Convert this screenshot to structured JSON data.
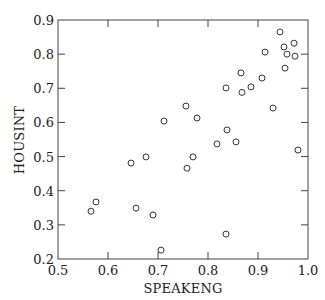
{
  "chart_data": {
    "type": "scatter",
    "title": "",
    "xlabel": "SPEAKENG",
    "ylabel": "HOUSINT",
    "xlim": [
      0.5,
      1.0
    ],
    "ylim": [
      0.2,
      0.9
    ],
    "xticks": [
      "0.5",
      "0.6",
      "0.7",
      "0.8",
      "0.9",
      "1.0"
    ],
    "yticks": [
      "0.2",
      "0.3",
      "0.4",
      "0.5",
      "0.6",
      "0.7",
      "0.8",
      "0.9"
    ],
    "grid": false,
    "legend": null,
    "marker": "open-circle",
    "points": [
      {
        "x": 0.944,
        "y": 0.865
      },
      {
        "x": 0.952,
        "y": 0.821
      },
      {
        "x": 0.972,
        "y": 0.832
      },
      {
        "x": 0.958,
        "y": 0.8
      },
      {
        "x": 0.974,
        "y": 0.794
      },
      {
        "x": 0.954,
        "y": 0.759
      },
      {
        "x": 0.914,
        "y": 0.806
      },
      {
        "x": 0.866,
        "y": 0.745
      },
      {
        "x": 0.908,
        "y": 0.73
      },
      {
        "x": 0.836,
        "y": 0.701
      },
      {
        "x": 0.886,
        "y": 0.704
      },
      {
        "x": 0.868,
        "y": 0.688
      },
      {
        "x": 0.93,
        "y": 0.642
      },
      {
        "x": 0.756,
        "y": 0.648
      },
      {
        "x": 0.712,
        "y": 0.604
      },
      {
        "x": 0.778,
        "y": 0.613
      },
      {
        "x": 0.838,
        "y": 0.578
      },
      {
        "x": 0.818,
        "y": 0.537
      },
      {
        "x": 0.856,
        "y": 0.543
      },
      {
        "x": 0.77,
        "y": 0.499
      },
      {
        "x": 0.758,
        "y": 0.466
      },
      {
        "x": 0.646,
        "y": 0.481
      },
      {
        "x": 0.676,
        "y": 0.499
      },
      {
        "x": 0.576,
        "y": 0.367
      },
      {
        "x": 0.566,
        "y": 0.34
      },
      {
        "x": 0.656,
        "y": 0.349
      },
      {
        "x": 0.69,
        "y": 0.329
      },
      {
        "x": 0.706,
        "y": 0.226
      },
      {
        "x": 0.836,
        "y": 0.273
      },
      {
        "x": 0.98,
        "y": 0.519
      }
    ]
  },
  "colors": {
    "axis": "#444444",
    "marker": "#333333",
    "text": "#222222"
  }
}
